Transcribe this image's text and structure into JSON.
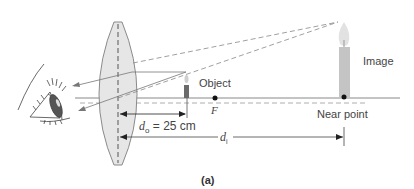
{
  "figure": {
    "panel_label": "(a)",
    "labels": {
      "object": "Object",
      "image": "Image",
      "focal_point": "F",
      "near_point": "Near point",
      "object_distance_symbol": "d",
      "object_distance_sub": "o",
      "object_distance_value": "= 25 cm",
      "image_distance_symbol": "d",
      "image_distance_sub": "i"
    },
    "colors": {
      "lens_fill": "#e6e6e6",
      "lens_stroke": "#8a8a8a",
      "ray": "#777777",
      "axis": "#888888",
      "candle": "#6b6b6b",
      "image_candle": "#c4c4c4",
      "text": "#444444"
    }
  }
}
